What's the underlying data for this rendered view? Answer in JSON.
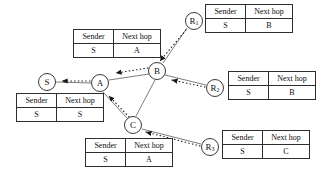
{
  "diagram": {
    "colors": {
      "node_stroke": "#3a3a3a",
      "link_stroke": "#6e6e6e",
      "arrow_fill": "#1a1a1a",
      "table_border": "#2e2e2e",
      "text": "#0d0d0d",
      "background": "#ffffff"
    },
    "nodes": [
      {
        "id": "S",
        "label": "S",
        "sub": "",
        "cx": 47,
        "cy": 82,
        "r": 9
      },
      {
        "id": "A",
        "label": "A",
        "sub": "",
        "cx": 100,
        "cy": 83,
        "r": 9
      },
      {
        "id": "B",
        "label": "B",
        "sub": "",
        "cx": 157,
        "cy": 71,
        "r": 9
      },
      {
        "id": "C",
        "label": "C",
        "sub": "",
        "cx": 133,
        "cy": 125,
        "r": 9
      },
      {
        "id": "R1",
        "label": "R",
        "sub": "1",
        "cx": 194,
        "cy": 21,
        "r": 9
      },
      {
        "id": "R2",
        "label": "R",
        "sub": "2",
        "cx": 215,
        "cy": 88,
        "r": 9
      },
      {
        "id": "R3",
        "label": "R",
        "sub": "3",
        "cx": 210,
        "cy": 147,
        "r": 9
      }
    ],
    "links": [
      {
        "from": "S",
        "to": "A",
        "style": "solid"
      },
      {
        "from": "A",
        "to": "B",
        "style": "solid"
      },
      {
        "from": "B",
        "to": "C",
        "style": "solid"
      },
      {
        "from": "A",
        "to": "C",
        "style": "solid"
      },
      {
        "from": "R1",
        "to": "B",
        "style": "solid"
      },
      {
        "from": "R2",
        "to": "B",
        "style": "solid"
      },
      {
        "from": "R3",
        "to": "C",
        "style": "solid"
      }
    ],
    "advertisements": [
      {
        "from": "A",
        "to": "S",
        "style": "dotted"
      },
      {
        "from": "B",
        "to": "A",
        "style": "dotted"
      },
      {
        "from": "C",
        "to": "A",
        "style": "dotted"
      },
      {
        "from": "R1",
        "to": "B",
        "style": "dotted"
      },
      {
        "from": "R2",
        "to": "B",
        "style": "dotted"
      },
      {
        "from": "R3",
        "to": "C",
        "style": "dotted"
      }
    ],
    "columns": {
      "sender": "Sender",
      "next_hop": "Next hop"
    },
    "tables": [
      {
        "id": "table-r1",
        "owner": "R1",
        "sender": "S",
        "next_hop": "B",
        "x": 205,
        "y": 4,
        "w": 85
      },
      {
        "id": "table-a",
        "owner": "A",
        "sender": "S",
        "next_hop": "A",
        "x": 73,
        "y": 29,
        "w": 85
      },
      {
        "id": "table-r2",
        "owner": "R2",
        "sender": "S",
        "next_hop": "B",
        "x": 228,
        "y": 71,
        "w": 85
      },
      {
        "id": "table-s",
        "owner": "S",
        "sender": "S",
        "next_hop": "S",
        "x": 16,
        "y": 93,
        "w": 85
      },
      {
        "id": "table-r3",
        "owner": "R3",
        "sender": "S",
        "next_hop": "C",
        "x": 222,
        "y": 130,
        "w": 85
      },
      {
        "id": "table-c",
        "owner": "C",
        "sender": "S",
        "next_hop": "A",
        "x": 85,
        "y": 138,
        "w": 85
      }
    ]
  }
}
